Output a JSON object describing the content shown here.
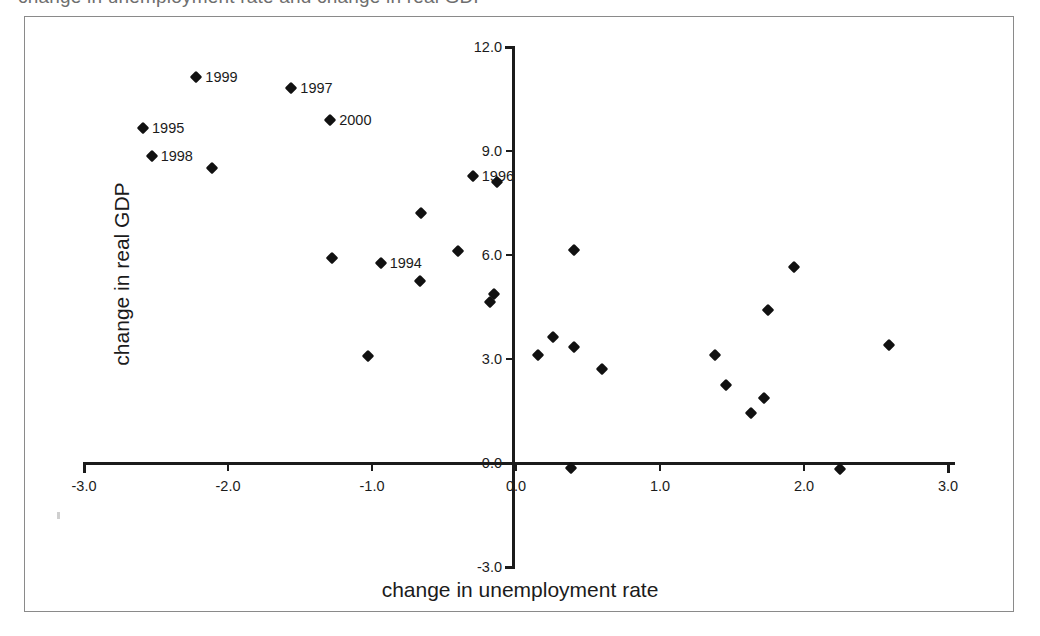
{
  "caption": {
    "partial_text_cropped": "change in unemployment rate and change in real GDP"
  },
  "axes": {
    "x_title": "change in unemployment rate",
    "y_title": "change in real GDP",
    "x_ticks": [
      "-3.0",
      "-2.0",
      "-1.0",
      "0.0",
      "1.0",
      "2.0",
      "3.0"
    ],
    "y_ticks": [
      "12.0",
      "9.0",
      "6.0",
      "3.0",
      "0.0",
      "-3.0"
    ]
  },
  "chart_data": {
    "type": "scatter",
    "title": "",
    "xlabel": "change in unemployment rate",
    "ylabel": "change in real GDP",
    "xlim": [
      -3.0,
      3.0
    ],
    "ylim": [
      -3.0,
      12.0
    ],
    "xticks": [
      -3.0,
      -2.0,
      -1.0,
      0.0,
      1.0,
      2.0,
      3.0
    ],
    "yticks": [
      -3.0,
      0.0,
      3.0,
      6.0,
      9.0,
      12.0
    ],
    "grid": false,
    "legend": null,
    "marker": "diamond",
    "marker_color": "#111111",
    "points": [
      {
        "x": -2.22,
        "y": 11.12,
        "label": "1999"
      },
      {
        "x": -1.56,
        "y": 10.8,
        "label": "1997"
      },
      {
        "x": -1.29,
        "y": 9.88,
        "label": "2000"
      },
      {
        "x": -2.59,
        "y": 9.65,
        "label": "1995"
      },
      {
        "x": -2.53,
        "y": 8.85,
        "label": "1998"
      },
      {
        "x": -0.3,
        "y": 8.27,
        "label": "1996"
      },
      {
        "x": -0.94,
        "y": 5.76,
        "label": "1994"
      },
      {
        "x": -2.11,
        "y": 8.5,
        "label": ""
      },
      {
        "x": -0.13,
        "y": 8.1,
        "label": ""
      },
      {
        "x": -0.66,
        "y": 7.2,
        "label": ""
      },
      {
        "x": -0.4,
        "y": 6.11,
        "label": ""
      },
      {
        "x": -1.28,
        "y": 5.92,
        "label": ""
      },
      {
        "x": 0.4,
        "y": 6.15,
        "label": ""
      },
      {
        "x": -0.67,
        "y": 5.25,
        "label": ""
      },
      {
        "x": 1.93,
        "y": 5.65,
        "label": ""
      },
      {
        "x": -0.15,
        "y": 4.88,
        "label": ""
      },
      {
        "x": -0.18,
        "y": 4.65,
        "label": ""
      },
      {
        "x": 1.75,
        "y": 4.4,
        "label": ""
      },
      {
        "x": 0.26,
        "y": 3.62,
        "label": ""
      },
      {
        "x": 0.4,
        "y": 3.33,
        "label": ""
      },
      {
        "x": 2.59,
        "y": 3.4,
        "label": ""
      },
      {
        "x": 0.15,
        "y": 3.1,
        "label": ""
      },
      {
        "x": 1.38,
        "y": 3.12,
        "label": ""
      },
      {
        "x": -1.03,
        "y": 3.08,
        "label": ""
      },
      {
        "x": 0.6,
        "y": 2.72,
        "label": ""
      },
      {
        "x": 1.46,
        "y": 2.25,
        "label": ""
      },
      {
        "x": 1.72,
        "y": 1.88,
        "label": ""
      },
      {
        "x": 1.63,
        "y": 1.45,
        "label": ""
      },
      {
        "x": 0.38,
        "y": -0.15,
        "label": ""
      },
      {
        "x": 2.25,
        "y": -0.18,
        "label": ""
      }
    ]
  }
}
